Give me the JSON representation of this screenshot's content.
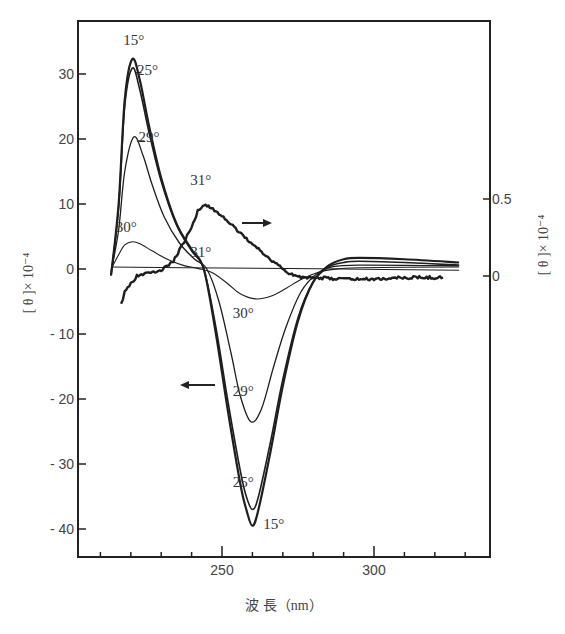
{
  "chart_data": {
    "type": "line",
    "title": "",
    "xlabel": "波 長（nm）",
    "ylabel": "[θ]×10⁻⁴",
    "ylabel_right": "[θ]×10⁻⁴",
    "xlim": [
      204,
      339
    ],
    "ylim": [
      -44,
      38
    ],
    "ylim_right": [
      -1.7,
      1.67
    ],
    "x_ticks": [
      {
        "value": 250,
        "label": "250"
      },
      {
        "value": 300,
        "label": "300"
      }
    ],
    "x_minor_ticks": [
      210,
      220,
      230,
      240,
      260,
      270,
      280,
      290,
      310,
      320,
      330
    ],
    "y_ticks": [
      {
        "value": 30,
        "label": "30"
      },
      {
        "value": 20,
        "label": "20"
      },
      {
        "value": 10,
        "label": "10"
      },
      {
        "value": 0,
        "label": "0"
      },
      {
        "value": -10,
        "label": "- 10"
      },
      {
        "value": -20,
        "label": "- 20"
      },
      {
        "value": -30,
        "label": "- 30"
      },
      {
        "value": -40,
        "label": "- 40"
      }
    ],
    "y_ticks_right": [
      {
        "value": 0.5,
        "label": "0.5"
      },
      {
        "value": 0,
        "label": "0"
      }
    ],
    "grid": false,
    "series": [
      {
        "name": "15°",
        "axis": "left",
        "stroke_width": 2.2,
        "x": [
          213.5,
          216,
          218,
          220.5,
          223,
          226,
          230,
          235,
          240,
          244,
          248,
          252,
          256,
          258,
          260,
          262,
          266,
          270,
          275,
          280,
          285,
          290,
          295,
          310,
          328
        ],
        "values": [
          -1,
          10,
          26,
          32.3,
          29,
          22,
          14,
          7,
          3,
          0,
          -10,
          -22,
          -33,
          -37,
          -39.5,
          -37,
          -28,
          -18,
          -8,
          -2,
          0.5,
          1.5,
          1.7,
          1.5,
          1.0
        ]
      },
      {
        "name": "25°",
        "axis": "left",
        "stroke_width": 1.6,
        "x": [
          213.5,
          216,
          218,
          220.5,
          223,
          226,
          230,
          235,
          240,
          244,
          248,
          252,
          256,
          258,
          260,
          262,
          266,
          270,
          275,
          280,
          285,
          290,
          295,
          310,
          328
        ],
        "values": [
          -1,
          9.5,
          25,
          30.9,
          27.5,
          21,
          13.5,
          6.8,
          2.8,
          0,
          -9,
          -20.5,
          -31,
          -35,
          -37,
          -35,
          -26.5,
          -17,
          -7.5,
          -2,
          0.3,
          1.0,
          1.2,
          1.0,
          0.6
        ]
      },
      {
        "name": "29°",
        "axis": "left",
        "stroke_width": 1.3,
        "x": [
          213.5,
          216,
          218,
          221,
          224,
          227,
          231,
          236,
          241,
          245,
          249,
          253,
          256,
          259.5,
          263,
          267,
          271,
          276,
          281,
          286,
          295,
          328
        ],
        "values": [
          -0.5,
          6,
          15,
          20.3,
          17.5,
          13,
          8,
          4,
          1.5,
          0,
          -5,
          -13,
          -19.5,
          -23.5,
          -21.5,
          -15,
          -9,
          -3.5,
          -0.8,
          0.3,
          0.6,
          0.5
        ]
      },
      {
        "name": "30°",
        "axis": "left",
        "stroke_width": 1.1,
        "x": [
          213.5,
          216,
          218,
          220.5,
          223,
          227,
          232,
          237,
          242,
          247,
          252,
          256,
          261,
          266,
          271,
          276,
          281,
          286,
          295,
          328
        ],
        "values": [
          0,
          2.2,
          3.7,
          4.2,
          3.9,
          2.8,
          1.5,
          0.6,
          0.1,
          -0.6,
          -2.3,
          -3.8,
          -4.6,
          -4.2,
          -3.0,
          -1.6,
          -0.6,
          -0.1,
          0.2,
          0.3
        ]
      },
      {
        "name": "31°",
        "axis": "left",
        "stroke_width": 1.1,
        "x": [
          213.5,
          250,
          290,
          328
        ],
        "values": [
          0.3,
          0.15,
          0,
          -0.2
        ]
      },
      {
        "name": "31°",
        "axis": "right",
        "stroke_width": 2.4,
        "noisy": true,
        "x": [
          216.8,
          218,
          220,
          222,
          225,
          228,
          231,
          234,
          237,
          240,
          242,
          243.7,
          246,
          248,
          251,
          255,
          259,
          262,
          265,
          268,
          272,
          276,
          280,
          290,
          300,
          310,
          322.7
        ],
        "values": [
          -0.19,
          -0.1,
          -0.05,
          0.0,
          0.02,
          0.02,
          0.05,
          0.1,
          0.2,
          0.32,
          0.42,
          0.46,
          0.45,
          0.42,
          0.37,
          0.3,
          0.22,
          0.18,
          0.12,
          0.08,
          0.02,
          -0.01,
          -0.01,
          -0.02,
          -0.02,
          -0.01,
          -0.01
        ]
      }
    ],
    "annotations": [
      {
        "text": "15°",
        "x": 221,
        "y": 34.5,
        "axis": "left"
      },
      {
        "text": "25°",
        "x": 225.5,
        "y": 29.8,
        "axis": "left"
      },
      {
        "text": "29°",
        "x": 226,
        "y": 19.5,
        "axis": "left"
      },
      {
        "text": "30°",
        "x": 218.5,
        "y": 5.7,
        "axis": "left"
      },
      {
        "text": "31°",
        "x": 243,
        "y": 13,
        "axis": "left"
      },
      {
        "text": "31°",
        "x": 243,
        "y": 1.8,
        "axis": "left"
      },
      {
        "text": "30°",
        "x": 257,
        "y": -7.5,
        "axis": "left"
      },
      {
        "text": "29°",
        "x": 257,
        "y": -19.5,
        "axis": "left"
      },
      {
        "text": "25°",
        "x": 257,
        "y": -33.5,
        "axis": "left"
      },
      {
        "text": "15°",
        "x": 267,
        "y": -40,
        "axis": "left"
      },
      {
        "text": "→",
        "meaning": "31° curve uses right axis",
        "x": 250,
        "y": 7
      },
      {
        "text": "←",
        "meaning": "other curves use left axis",
        "x": 236,
        "y": -18
      }
    ],
    "legend": null
  },
  "labels": {
    "xlabel": "波  長（nm）",
    "ylabel_left": "[ θ ]× 10⁻⁴",
    "ylabel_right": "[ θ ]× 10⁻⁴"
  }
}
